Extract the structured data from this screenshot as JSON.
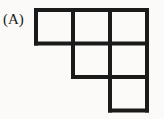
{
  "figure": {
    "label": "(A)",
    "background_color": "#fbfaf8",
    "line_color": "#1a1a1a",
    "line_width_px": 4,
    "cell_width_px": 37,
    "cell_height_px": 33.5,
    "origin_x_px": 36,
    "origin_y_px": 10,
    "columns": 3,
    "rows": 3,
    "cells_per_row": [
      3,
      2,
      1
    ],
    "total_cells": 6,
    "grid": [
      [
        1,
        1,
        1
      ],
      [
        0,
        1,
        1
      ],
      [
        0,
        0,
        1
      ]
    ],
    "filled_cells": [
      {
        "row": 1,
        "col": 1
      },
      {
        "row": 1,
        "col": 2
      },
      {
        "row": 1,
        "col": 3
      },
      {
        "row": 2,
        "col": 2
      },
      {
        "row": 2,
        "col": 3
      },
      {
        "row": 3,
        "col": 3
      }
    ]
  }
}
